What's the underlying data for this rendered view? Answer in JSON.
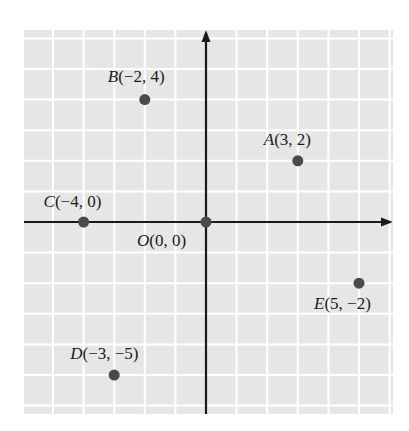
{
  "figure": {
    "origin_px": [
      206,
      222
    ],
    "unit_px": 30.6,
    "grid": {
      "left": 24,
      "top": 30,
      "right": 393,
      "bottom": 414,
      "bg": "#e6e6e6",
      "line": "#ffffff"
    },
    "axis_color": "#1a1a1a",
    "point_color": "#4a4a4a"
  },
  "points": [
    {
      "name": "A",
      "coords": "(3, 2)",
      "x": 3,
      "y": 2,
      "label_dx": -34,
      "label_dy": -16
    },
    {
      "name": "B",
      "coords": "(−2, 4)",
      "x": -2,
      "y": 4,
      "label_dx": -37,
      "label_dy": -18
    },
    {
      "name": "C",
      "coords": "(−4, 0)",
      "x": -4,
      "y": 0,
      "label_dx": -40,
      "label_dy": -15
    },
    {
      "name": "O",
      "coords": "(0, 0)",
      "x": 0,
      "y": 0,
      "label_dx": -69,
      "label_dy": 24
    },
    {
      "name": "E",
      "coords": "(5, −2)",
      "x": 5,
      "y": -2,
      "label_dx": -45,
      "label_dy": 26
    },
    {
      "name": "D",
      "coords": "(−3, −5)",
      "x": -3,
      "y": -5,
      "label_dx": -44,
      "label_dy": -16
    }
  ]
}
